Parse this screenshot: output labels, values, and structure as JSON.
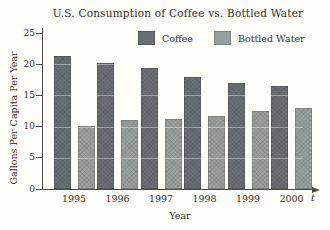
{
  "title": "U.S. Consumption of Coffee vs. Bottled Water",
  "axes": {
    "y_label": "Gallons Per Capita Per Year",
    "x_label": "Year",
    "x_axis_end_label": "t",
    "y_ticks": [
      "0",
      "5",
      "10",
      "15",
      "20",
      "25"
    ]
  },
  "colors": {
    "coffee_bar": "#696e70",
    "bottled_water_bar": "#999e9d",
    "axis": "#4d4a45",
    "text": "#35302a",
    "background": "#fcfcf9"
  },
  "chart_data": {
    "type": "bar",
    "title": "U.S. Consumption of Coffee vs. Bottled Water",
    "categories": [
      "1995",
      "1996",
      "1997",
      "1998",
      "1999",
      "2000"
    ],
    "series": [
      {
        "name": "Coffee",
        "color": "#696e70",
        "values": [
          21.3,
          20.2,
          19.4,
          17.9,
          17.0,
          16.5
        ]
      },
      {
        "name": "Bottled Water",
        "color": "#999e9d",
        "values": [
          10.1,
          11.0,
          11.3,
          11.7,
          12.5,
          13.0
        ]
      }
    ],
    "xlabel": "Year",
    "ylabel": "Gallons Per Capita Per Year",
    "ylim": [
      0,
      25
    ],
    "y_tick_step": 5,
    "grid": false,
    "legend_position": "top"
  }
}
